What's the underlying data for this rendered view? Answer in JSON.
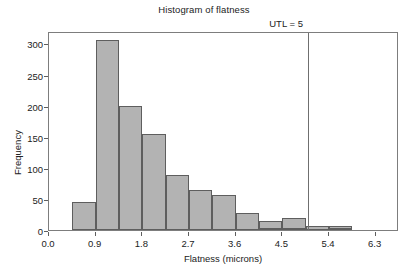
{
  "chart_data": {
    "type": "bar",
    "title": "Histogram of flatness",
    "xlabel": "Flatness (microns)",
    "ylabel": "Frequency",
    "xlim": [
      0.0,
      6.75
    ],
    "ylim": [
      0,
      320
    ],
    "grid": false,
    "legend": null,
    "bin_width": 0.45,
    "bin_starts": [
      0.45,
      0.9,
      1.35,
      1.8,
      2.25,
      2.7,
      3.15,
      3.6,
      4.05,
      4.5,
      4.95,
      5.4,
      5.85
    ],
    "categories": [
      "0.45-0.90",
      "0.90-1.35",
      "1.35-1.80",
      "1.80-2.25",
      "2.25-2.70",
      "2.70-3.15",
      "3.15-3.60",
      "3.60-4.05",
      "4.05-4.50",
      "4.50-4.95",
      "4.95-5.40",
      "5.40-5.85",
      "5.85-6.30"
    ],
    "values": [
      45,
      306,
      200,
      155,
      89,
      64,
      57,
      28,
      15,
      20,
      6,
      6,
      0
    ],
    "extra_bins": {
      "starts": [
        4.05,
        4.5,
        5.4,
        5.85
      ],
      "values": [
        3,
        1,
        1,
        0
      ]
    },
    "xticks": [
      "0.0",
      "0.9",
      "1.8",
      "2.7",
      "3.6",
      "4.5",
      "5.4",
      "6.3"
    ],
    "xtick_values": [
      0.0,
      0.9,
      1.8,
      2.7,
      3.6,
      4.5,
      5.4,
      6.3
    ],
    "yticks": [
      "0",
      "50",
      "100",
      "150",
      "200",
      "250",
      "300"
    ],
    "ytick_values": [
      0,
      50,
      100,
      150,
      200,
      250,
      300
    ],
    "annotations": [
      {
        "name": "utl-reference-line",
        "label": "UTL = 5",
        "x_value": 5.0,
        "color": "#6f6f6f"
      }
    ],
    "colors": {
      "bar_fill": "#b3b3b3",
      "bar_edge": "#5e5e5e",
      "axis": "#7d7d7d",
      "text": "#222222",
      "background": "#ffffff"
    }
  }
}
